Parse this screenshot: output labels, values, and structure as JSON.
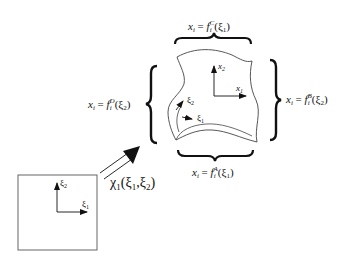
{
  "diagram": {
    "type": "mapping-transfinite-interpolation",
    "edges": {
      "top": {
        "lhs": "x",
        "lhs_sub": "i",
        "eq": " = ",
        "f": "f",
        "f_sub": "i",
        "f_sup": "C",
        "arg": "(ξ",
        "arg_sub": "1",
        "close": ")"
      },
      "bottom": {
        "lhs": "x",
        "lhs_sub": "i",
        "eq": " = ",
        "f": "f",
        "f_sub": "i",
        "f_sup": "A",
        "arg": "(ξ",
        "arg_sub": "1",
        "close": ")"
      },
      "left": {
        "lhs": "x",
        "lhs_sub": "i",
        "eq": " = ",
        "f": "f",
        "f_sub": "i",
        "f_sup": "D",
        "arg": "(ξ",
        "arg_sub": "2",
        "close": ")"
      },
      "right": {
        "lhs": "x",
        "lhs_sub": "i",
        "eq": " = ",
        "f": "f",
        "f_sub": "i",
        "f_sup": "B",
        "arg": "(ξ",
        "arg_sub": "2",
        "close": ")"
      }
    },
    "physical_axes": {
      "x1": {
        "base": "x",
        "sub": "1"
      },
      "x2": {
        "base": "x",
        "sub": "2"
      }
    },
    "curvilinear_axes": {
      "xi1": {
        "base": "ξ",
        "sub": "1"
      },
      "xi2": {
        "base": "ξ",
        "sub": "2"
      }
    },
    "reference_axes": {
      "xi1": {
        "base": "ξ",
        "sub": "1"
      },
      "xi2": {
        "base": "ξ",
        "sub": "2"
      }
    },
    "mapping": {
      "symbol": "χ",
      "sub": "1",
      "args": "(ξ",
      "a1": "1",
      "sep": ",ξ",
      "a2": "2",
      "close": ")"
    },
    "colors": {
      "stroke": "#111111",
      "outline": "#555555",
      "background": "#ffffff"
    }
  }
}
